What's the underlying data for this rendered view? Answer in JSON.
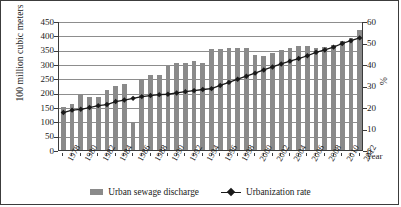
{
  "chart_data": {
    "type": "bar",
    "title": "",
    "xlabel": "Year",
    "ylabel": "100 million cubic meters",
    "ylabel_secondary": "%",
    "ylim": [
      0,
      450
    ],
    "ylim_secondary": [
      0,
      60
    ],
    "ytick_step": 50,
    "ytick_step_secondary": 10,
    "yticks": [
      "0",
      "50",
      "100",
      "150",
      "200",
      "250",
      "300",
      "350",
      "400",
      "450"
    ],
    "yticks_secondary": [
      "0",
      "10",
      "20",
      "30",
      "40",
      "50",
      "60"
    ],
    "grid": true,
    "legend_position": "bottom",
    "x": [
      1978,
      1979,
      1980,
      1981,
      1982,
      1983,
      1984,
      1985,
      1986,
      1987,
      1988,
      1989,
      1990,
      1991,
      1992,
      1993,
      1994,
      1995,
      1996,
      1997,
      1998,
      1999,
      2000,
      2001,
      2002,
      2003,
      2004,
      2005,
      2006,
      2007,
      2008,
      2009,
      2010,
      2011,
      2012
    ],
    "xtick_labels": [
      "1978",
      "1980",
      "1982",
      "1984",
      "1986",
      "1988",
      "1990",
      "1992",
      "1994",
      "1996",
      "1998",
      "2000",
      "2002",
      "2004",
      "2006",
      "2008",
      "2010",
      "2012"
    ],
    "categories": [
      "1978",
      "1979",
      "1980",
      "1981",
      "1982",
      "1983",
      "1984",
      "1985",
      "1986",
      "1987",
      "1988",
      "1989",
      "1990",
      "1991",
      "1992",
      "1993",
      "1994",
      "1995",
      "1996",
      "1997",
      "1998",
      "1999",
      "2000",
      "2001",
      "2002",
      "2003",
      "2004",
      "2005",
      "2006",
      "2007",
      "2008",
      "2009",
      "2010",
      "2011",
      "2012"
    ],
    "series": [
      {
        "name": "Urban sewage discharge",
        "type": "bar",
        "axis": "left",
        "unit": "100 million cubic meters",
        "color": "#8a8a8a",
        "values": [
          150,
          162,
          194,
          184,
          186,
          210,
          225,
          230,
          97,
          249,
          261,
          261,
          294,
          303,
          303,
          312,
          305,
          353,
          353,
          355,
          356,
          356,
          332,
          329,
          337,
          349,
          357,
          362,
          363,
          357,
          359,
          365,
          379,
          390,
          420
        ]
      },
      {
        "name": "Urbanization rate",
        "type": "line",
        "axis": "right",
        "unit": "%",
        "color": "#1a1a1a",
        "marker": "diamond",
        "values": [
          17.9,
          19.0,
          19.4,
          20.2,
          21.1,
          21.6,
          23.0,
          23.7,
          24.5,
          25.3,
          25.8,
          26.2,
          26.4,
          27.0,
          27.6,
          28.1,
          28.6,
          29.0,
          30.5,
          31.9,
          33.4,
          34.8,
          36.2,
          37.7,
          39.1,
          40.5,
          41.8,
          43.0,
          44.3,
          45.9,
          47.0,
          48.3,
          50.0,
          51.3,
          52.6
        ]
      }
    ],
    "legend": [
      "Urban sewage discharge",
      "Urbanization rate"
    ]
  }
}
